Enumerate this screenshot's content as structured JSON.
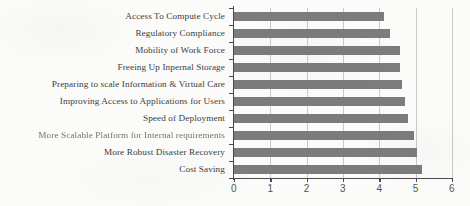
{
  "chart_data": {
    "type": "bar",
    "orientation": "horizontal",
    "title": "",
    "subtitle": "",
    "xlabel": "",
    "ylabel": "",
    "xlim": [
      0,
      6
    ],
    "ylim": null,
    "grid": true,
    "legend": false,
    "legend_position": "none",
    "bar_color": "#7c7c7c",
    "axis_color": "#4a4a4a",
    "gridline_color": "#c9c9c7",
    "categories": [
      "Access To Compute Cycle",
      "Regulatory Compliance",
      "Mobility of Work Force",
      "Freeing Up Inpernal Storage",
      "Preparing to scale Information & Virtual Care",
      "Improving Access to Applications for Users",
      "Speed of Deployment",
      "More Scalable Platform for Internal requirements",
      "More Robust Disaster Recovery",
      "Cost Saving"
    ],
    "values": [
      4.13,
      4.28,
      4.57,
      4.58,
      4.62,
      4.72,
      4.8,
      4.95,
      5.05,
      5.18
    ],
    "xticks": [
      0,
      1,
      2,
      3,
      4,
      5,
      6
    ],
    "xtick_labels": [
      "0",
      "1",
      "2",
      "3",
      "4",
      "5",
      "6"
    ]
  },
  "chart": {
    "label_blurred_index": 7
  }
}
